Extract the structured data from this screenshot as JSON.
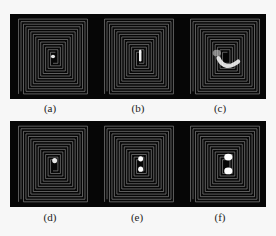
{
  "figure": {
    "panels": [
      {
        "id": "a",
        "label": "(a)",
        "row": 0,
        "col": 0,
        "spot": "small-center"
      },
      {
        "id": "b",
        "label": "(b)",
        "row": 0,
        "col": 1,
        "spot": "vertical-bar"
      },
      {
        "id": "c",
        "label": "(c)",
        "row": 0,
        "col": 2,
        "spot": "crescent"
      },
      {
        "id": "d",
        "label": "(d)",
        "row": 1,
        "col": 0,
        "spot": "small-center"
      },
      {
        "id": "e",
        "label": "(e)",
        "row": 1,
        "col": 1,
        "spot": "double-dot"
      },
      {
        "id": "f",
        "label": "(f)",
        "row": 1,
        "col": 2,
        "spot": "double-dot-large"
      }
    ],
    "colors": {
      "background": "#060606",
      "trace": "#8a8a8a",
      "hotspot": "#ffffff"
    }
  }
}
